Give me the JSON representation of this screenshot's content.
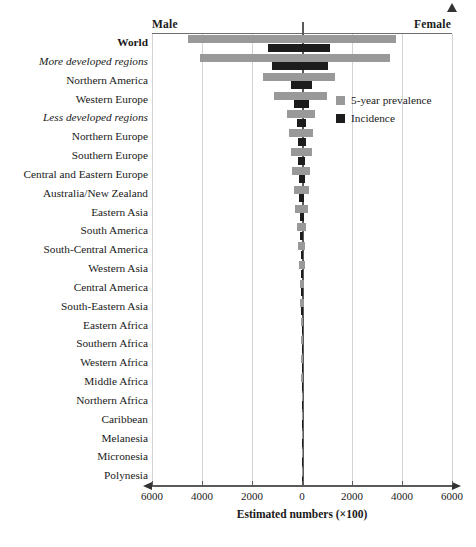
{
  "chart_data": {
    "type": "bar",
    "orientation": "horizontal-diverging",
    "title": "",
    "xlabel": "Estimated numbers (×100)",
    "ylabel": "",
    "xlim": [
      -6000,
      6000
    ],
    "xticks": [
      6000,
      4000,
      2000,
      0,
      2000,
      4000,
      6000
    ],
    "grid": true,
    "left_side_label": "Male",
    "right_side_label": "Female",
    "legend": {
      "position": "upper-right-inside",
      "entries": [
        {
          "name": "5-year prevalence",
          "color": "#999999"
        },
        {
          "name": "Incidence",
          "color": "#1c1c1c"
        }
      ]
    },
    "categories": [
      "World",
      "More developed regions",
      "Northern America",
      "Western Europe",
      "Less developed regions",
      "Northern Europe",
      "Southern Europe",
      "Central and Eastern Europe",
      "Australia/New Zealand",
      "Eastern Asia",
      "South America",
      "South-Central America",
      "Western Asia",
      "Central America",
      "South-Eastern Asia",
      "Eastern Africa",
      "Southern Africa",
      "Western Africa",
      "Middle Africa",
      "Northern Africa",
      "Caribbean",
      "Melanesia",
      "Micronesia",
      "Polynesia"
    ],
    "category_styles": [
      "bold",
      "italic",
      "normal",
      "normal",
      "italic",
      "normal",
      "normal",
      "normal",
      "normal",
      "normal",
      "normal",
      "normal",
      "normal",
      "normal",
      "normal",
      "normal",
      "normal",
      "normal",
      "normal",
      "normal",
      "normal",
      "normal",
      "normal",
      "normal"
    ],
    "series": [
      {
        "name": "5-year prevalence",
        "color": "#999999",
        "male": [
          4560,
          4080,
          1560,
          1120,
          620,
          520,
          460,
          400,
          340,
          280,
          200,
          150,
          120,
          90,
          70,
          55,
          45,
          35,
          25,
          20,
          12,
          8,
          4,
          2
        ],
        "female": [
          3760,
          3520,
          1320,
          1000,
          520,
          440,
          380,
          330,
          280,
          230,
          170,
          130,
          100,
          75,
          60,
          45,
          38,
          30,
          20,
          16,
          10,
          6,
          3,
          2
        ]
      },
      {
        "name": "Incidence",
        "color": "#1c1c1c",
        "male": [
          1360,
          1200,
          440,
          320,
          200,
          170,
          150,
          130,
          110,
          90,
          65,
          50,
          40,
          30,
          24,
          18,
          15,
          12,
          9,
          7,
          4,
          3,
          1.5,
          1
        ],
        "female": [
          1120,
          1040,
          380,
          280,
          170,
          145,
          125,
          110,
          95,
          76,
          56,
          43,
          33,
          25,
          20,
          15,
          13,
          10,
          7,
          5,
          3,
          2,
          1,
          0.6
        ]
      }
    ]
  }
}
